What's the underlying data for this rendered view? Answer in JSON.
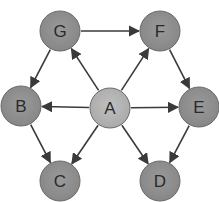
{
  "diagram": {
    "type": "directed-graph",
    "colors": {
      "node_fill": "#8e8e8e",
      "node_stroke": "#6a6a6a",
      "center_fill": "#b4b4b4",
      "edge": "#3a3a3a",
      "label": "#2a2a2a"
    },
    "nodes": [
      {
        "id": "G",
        "label": "G",
        "x": 60,
        "y": 31
      },
      {
        "id": "F",
        "label": "F",
        "x": 160,
        "y": 31
      },
      {
        "id": "B",
        "label": "B",
        "x": 21,
        "y": 106
      },
      {
        "id": "A",
        "label": "A",
        "x": 110,
        "y": 108
      },
      {
        "id": "E",
        "label": "E",
        "x": 199,
        "y": 107
      },
      {
        "id": "C",
        "label": "C",
        "x": 60,
        "y": 181
      },
      {
        "id": "D",
        "label": "D",
        "x": 160,
        "y": 181
      }
    ],
    "edges": [
      {
        "from": "G",
        "to": "F"
      },
      {
        "from": "G",
        "to": "B"
      },
      {
        "from": "A",
        "to": "G"
      },
      {
        "from": "A",
        "to": "F"
      },
      {
        "from": "A",
        "to": "B"
      },
      {
        "from": "A",
        "to": "E"
      },
      {
        "from": "A",
        "to": "C"
      },
      {
        "from": "A",
        "to": "D"
      },
      {
        "from": "F",
        "to": "E"
      },
      {
        "from": "B",
        "to": "C"
      },
      {
        "from": "E",
        "to": "D"
      }
    ]
  }
}
